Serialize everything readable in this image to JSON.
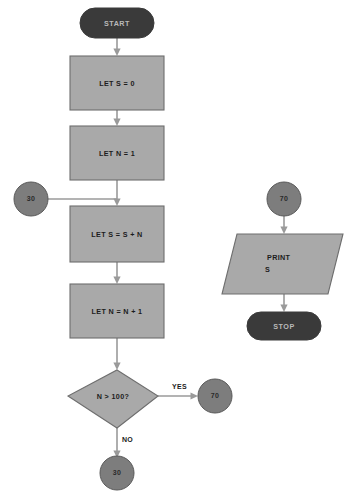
{
  "diagram": {
    "type": "flowchart",
    "colors": {
      "process_fill": "#a9a9a9",
      "process_stroke": "#6e6e6e",
      "terminal_fill": "#3a3a3a",
      "terminal_text": "#b9b9b9",
      "connector_fill": "#7d7d7d",
      "line": "#9a9a9a",
      "text": "#1c1c1c",
      "background": "#ffffff"
    }
  },
  "nodes": {
    "start_terminal": {
      "label": "START",
      "shape": "terminal"
    },
    "process_let_s_0": {
      "label": "LET S = 0",
      "shape": "process"
    },
    "process_let_n_1": {
      "label": "LET N = 1",
      "shape": "process"
    },
    "connector_in_30": {
      "label": "30",
      "shape": "connector"
    },
    "process_let_s_sum": {
      "label": "LET S = S + N",
      "shape": "process"
    },
    "process_let_n_inc": {
      "label": "LET N = N + 1",
      "shape": "process"
    },
    "decision_n_gt_100": {
      "label": "N > 100?",
      "shape": "decision"
    },
    "connector_yes_70": {
      "label": "70",
      "shape": "connector"
    },
    "connector_no_30": {
      "label": "30",
      "shape": "connector"
    },
    "connector_out_70": {
      "label": "70",
      "shape": "connector"
    },
    "output_print": {
      "label_line1": "PRINT",
      "label_line2": "S",
      "shape": "output-parallelogram"
    },
    "stop_terminal": {
      "label": "STOP",
      "shape": "terminal"
    }
  },
  "edge_labels": {
    "yes": "YES",
    "no": "NO"
  }
}
